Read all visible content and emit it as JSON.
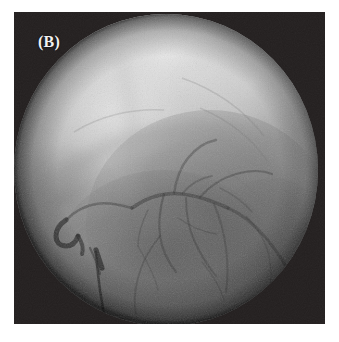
{
  "figure": {
    "panel_label": "(B)",
    "modality": "coronary-angiogram",
    "frame": {
      "x": 14,
      "y": 12,
      "width": 311,
      "height": 312,
      "background_color": "#231f1f",
      "border_color": "#ffffff"
    },
    "field_of_view": {
      "shape": "circle",
      "center_x": 152,
      "center_y": 158,
      "radius_x": 152,
      "radius_y": 156,
      "vignette": true
    },
    "label_style": {
      "color": "#f2f2f2",
      "left": 24,
      "top": 22,
      "font_size": 16,
      "bold": true
    },
    "palette": {
      "corner_dark": "#231f1f",
      "field_bright": "#c9c9c9",
      "field_highlight": "#dcdcdc",
      "field_mid": "#9a9a9a",
      "field_shadow": "#6a6a6a",
      "field_deep_shadow": "#4e4e4e",
      "vessel_dark": "#3c3c3c",
      "vessel_mid": "#565656",
      "catheter": "#2e2e2e",
      "lead": "#303030",
      "page_background": "#ffffff"
    },
    "anatomy": {
      "bright_upper_lobe": "left anterior / diaphragm-lung interface, brightest at upper center",
      "cardiac_silhouette": "rounded heart border sweeping from upper-left across to right",
      "coronary_tree": "contrast filled branching arteries in the central third",
      "catheter_tip": "hooked catheter tip at mid-left of field",
      "pacing_lead": "vertical radiopaque lead in lower-left quadrant"
    },
    "vessels": [
      {
        "name": "proximal-main-trunk",
        "d": "M 118 196 C 132 186 150 180 168 182 C 186 184 200 190 214 196",
        "width": 3.6,
        "opacity": 0.52
      },
      {
        "name": "main-trunk-continuation",
        "d": "M 214 196 C 228 202 240 212 252 226 C 262 238 270 250 276 262",
        "width": 3.0,
        "opacity": 0.46
      },
      {
        "name": "proximal-hook-to-catheter",
        "d": "M 118 196 C 104 192 92 190 82 192 C 70 194 60 200 52 208",
        "width": 2.6,
        "opacity": 0.44
      },
      {
        "name": "upper-diagonal-branch",
        "d": "M 160 181 C 162 168 166 156 174 146 C 182 136 192 130 202 128",
        "width": 2.4,
        "opacity": 0.4
      },
      {
        "name": "upper-diagonal-branch-2",
        "d": "M 186 185 C 196 174 208 166 222 162 C 236 158 248 158 258 162",
        "width": 2.2,
        "opacity": 0.38
      },
      {
        "name": "septal-branch-1",
        "d": "M 150 182 C 146 196 144 210 146 224 C 148 238 154 250 162 260",
        "width": 2.2,
        "opacity": 0.42
      },
      {
        "name": "septal-branch-2",
        "d": "M 172 186 C 172 200 174 214 180 228 C 186 242 194 254 202 264",
        "width": 2.0,
        "opacity": 0.38
      },
      {
        "name": "obtuse-marginal",
        "d": "M 200 192 C 206 206 210 220 212 236 C 214 252 214 266 212 280",
        "width": 2.0,
        "opacity": 0.36
      },
      {
        "name": "distal-branch-left",
        "d": "M 146 224 C 136 236 128 250 124 266 C 120 280 120 292 122 302",
        "width": 1.8,
        "opacity": 0.34
      },
      {
        "name": "small-branch-a",
        "d": "M 134 198 C 128 210 124 222 124 234",
        "width": 1.5,
        "opacity": 0.3
      },
      {
        "name": "small-branch-b",
        "d": "M 232 204 C 242 214 250 226 254 240",
        "width": 1.5,
        "opacity": 0.3
      },
      {
        "name": "small-branch-c",
        "d": "M 188 250 C 198 262 206 274 210 288",
        "width": 1.4,
        "opacity": 0.28
      },
      {
        "name": "small-branch-d",
        "d": "M 164 206 C 176 214 188 220 202 222",
        "width": 1.4,
        "opacity": 0.28
      },
      {
        "name": "small-branch-e",
        "d": "M 206 176 C 218 182 230 190 238 200",
        "width": 1.4,
        "opacity": 0.26
      }
    ],
    "devices": [
      {
        "name": "catheter-tip",
        "d": "M 52 208 C 46 212 42 218 42 224 C 42 230 46 234 52 234 C 58 234 62 230 64 224",
        "width": 5.0,
        "opacity": 0.7
      },
      {
        "name": "catheter-hook",
        "d": "M 64 224 C 68 230 70 236 68 242",
        "width": 4.0,
        "opacity": 0.62
      },
      {
        "name": "pacing-lead-shaft",
        "d": "M 82 240 C 84 268 88 296 94 320",
        "width": 2.6,
        "opacity": 0.68
      },
      {
        "name": "pacing-lead-tip",
        "d": "M 82 238 C 84 244 86 250 88 256",
        "width": 5.2,
        "opacity": 0.72
      }
    ]
  }
}
